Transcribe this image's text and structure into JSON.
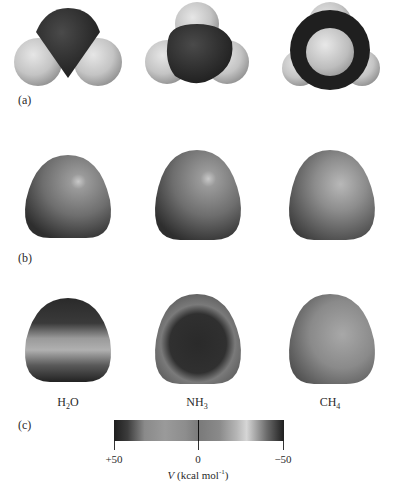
{
  "figure": {
    "panels": [
      {
        "id": "a",
        "label": "(a)",
        "type": "space-filling models"
      },
      {
        "id": "b",
        "label": "(b)",
        "type": "electron density surfaces"
      },
      {
        "id": "c",
        "label": "(c)",
        "type": "electrostatic potential maps"
      }
    ],
    "molecules": [
      {
        "formula_main": "H",
        "formula_sub": "2",
        "formula_tail": "O"
      },
      {
        "formula_main": "NH",
        "formula_sub": "3",
        "formula_tail": ""
      },
      {
        "formula_main": "CH",
        "formula_sub": "4",
        "formula_tail": ""
      }
    ],
    "colorbar": {
      "ticks": [
        "+50",
        "0",
        "−50"
      ],
      "axis_var": "V",
      "axis_units_pre": " (kcal mol",
      "axis_units_sup": "-1",
      "axis_units_post": ")",
      "range": [
        50,
        -50
      ]
    },
    "colors": {
      "dark_atom": "#2e2e2e",
      "light_atom": "#cfcfcf",
      "surface_mid": "#7e7e7e",
      "background": "#ffffff"
    }
  }
}
